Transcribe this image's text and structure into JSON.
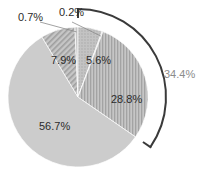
{
  "chart_data": {
    "type": "pie",
    "title": "",
    "subtitle": "",
    "xlabel": "",
    "ylabel": "",
    "legend_position": "none",
    "grid": false,
    "labels_shown_as": "percent",
    "start_angle_deg": 0,
    "direction": "clockwise",
    "categories": [
      "5.6%",
      "0.2%",
      "28.8%",
      "56.7%",
      "7.9%",
      "0.7%"
    ],
    "values": [
      5.6,
      0.2,
      28.8,
      56.7,
      7.9,
      0.7
    ],
    "slices": [
      {
        "label": "5.6%",
        "value": 5.6,
        "fill": "#b9b9b9",
        "pattern": "dots",
        "label_x": 101,
        "label_y": 62,
        "label_anchor": "middle",
        "label_color": "#2b2b2b",
        "leader": false
      },
      {
        "label": "0.2%",
        "value": 0.2,
        "fill": "#c9c9c9",
        "pattern": "solid",
        "label_x": 72,
        "label_y": 14,
        "label_anchor": "middle",
        "label_color": "#2b2b2b",
        "leader": true
      },
      {
        "label": "28.8%",
        "value": 28.8,
        "fill": "#b4b4b4",
        "pattern": "vstripes",
        "label_x": 127,
        "label_y": 101,
        "label_anchor": "middle",
        "label_color": "#2b2b2b",
        "leader": false
      },
      {
        "label": "56.7%",
        "value": 56.7,
        "fill": "#cccccc",
        "pattern": "solid",
        "label_x": 55,
        "label_y": 128,
        "label_anchor": "middle",
        "label_color": "#2b2b2b",
        "leader": false
      },
      {
        "label": "7.9%",
        "value": 7.9,
        "fill": "#bdbdbd",
        "pattern": "diagonal",
        "label_x": 67,
        "label_y": 62,
        "label_anchor": "middle",
        "label_color": "#2b2b2b",
        "leader": false
      },
      {
        "label": "0.7%",
        "value": 0.7,
        "fill": "#c4c4c4",
        "pattern": "solid",
        "label_x": 31,
        "label_y": 19,
        "label_anchor": "middle",
        "label_color": "#2b2b2b",
        "leader": true
      }
    ],
    "annotations": [
      {
        "name": "group-bracket",
        "label": "34.4%",
        "value": 34.4,
        "label_x": 180,
        "label_y": 76,
        "color": "#8c8c8c",
        "arc_color": "#3a3a3a",
        "covers": [
          "5.6%",
          "0.2%",
          "28.8%"
        ],
        "span_start_deg": 0,
        "span_end_deg": 124
      }
    ],
    "geometry": {
      "center_x": 78,
      "center_y": 97,
      "radius": 70,
      "bracket_radius": 88
    },
    "colors": {
      "background": "#ffffff",
      "text": "#2b2b2b",
      "bracket_text": "#8c8c8c",
      "bracket_line": "#3a3a3a",
      "leader_line": "#7a7a7a",
      "pie_base": "#c8c8c8"
    }
  }
}
